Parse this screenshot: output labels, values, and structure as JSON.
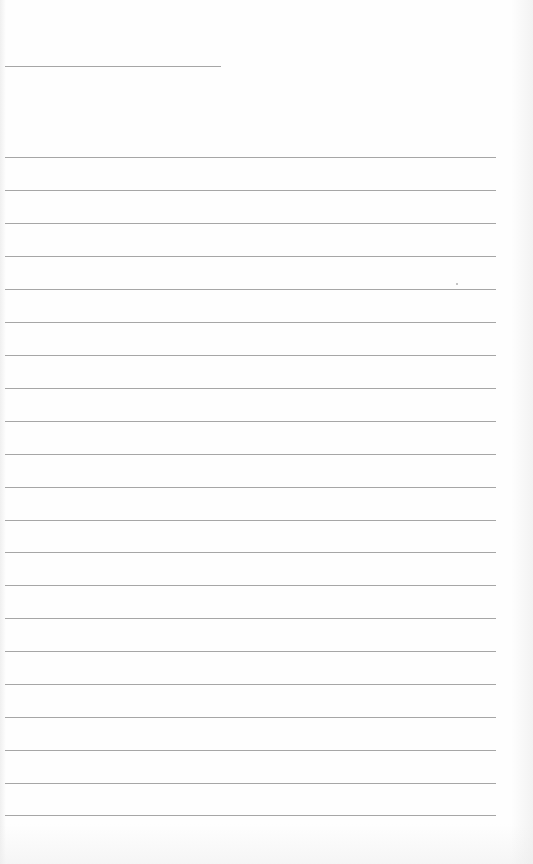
{
  "page": {
    "type": "lined-paper",
    "background_color": "#ffffff",
    "line_color": "#a6a6a6",
    "header_line": {
      "x1": 5,
      "x2": 221,
      "y": 66
    },
    "ruled_lines": {
      "x1": 5,
      "x2": 496,
      "y_positions": [
        157,
        190,
        223,
        256,
        289,
        322,
        355,
        388,
        421,
        454,
        487,
        520,
        552,
        585,
        618,
        651,
        684,
        717,
        750,
        783,
        815
      ]
    },
    "text_content": []
  }
}
